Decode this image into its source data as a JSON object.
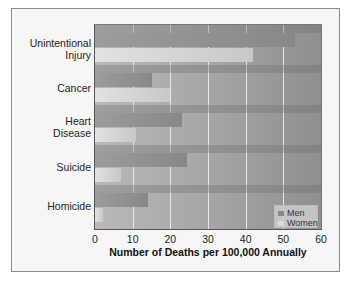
{
  "chart_data": {
    "type": "bar",
    "orientation": "horizontal",
    "title": "",
    "xlabel": "Number of Deaths per 100,000 Annually",
    "ylabel": "",
    "categories": [
      "Unintentional Injury",
      "Cancer",
      "Heart Disease",
      "Suicide",
      "Homicide"
    ],
    "category_label_lines": [
      [
        "Unintentional",
        "Injury"
      ],
      [
        "Cancer"
      ],
      [
        "Heart",
        "Disease"
      ],
      [
        "Suicide"
      ],
      [
        "Homicide"
      ]
    ],
    "series": [
      {
        "name": "Men",
        "values": [
          53,
          15,
          23,
          24.5,
          14
        ],
        "color": "#8f8f8f"
      },
      {
        "name": "Women",
        "values": [
          42,
          20,
          11,
          7,
          2
        ],
        "color": "#dcdcdc"
      }
    ],
    "xlim": [
      0,
      60
    ],
    "xticks": [
      "0",
      "10",
      "20",
      "30",
      "40",
      "50",
      "60"
    ],
    "grid": "vertical",
    "legend_position": "lower right"
  },
  "legend": {
    "men": "Men",
    "women": "Women"
  },
  "labels": {
    "cat0_l1": "Unintentional",
    "cat0_l2": "Injury",
    "cat1": "Cancer",
    "cat2_l1": "Heart",
    "cat2_l2": "Disease",
    "cat3": "Suicide",
    "cat4": "Homicide"
  }
}
